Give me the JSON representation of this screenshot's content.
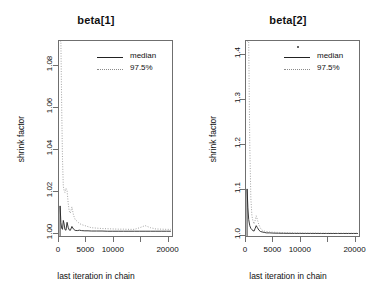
{
  "figure": {
    "xlabel": "last iteration in chain",
    "ylabel": "shrink factor",
    "legend": {
      "median_label": "median",
      "upper_label": "97.5%",
      "median_color": "#222222",
      "upper_color": "#8a8a8a"
    }
  },
  "chart_data": [
    {
      "type": "line",
      "title": "beta[1]",
      "xlabel": "last iteration in chain",
      "ylabel": "shrink factor",
      "xlim": [
        0,
        21000
      ],
      "ylim": [
        0.998,
        1.092
      ],
      "grid": false,
      "legend_position": "top-right",
      "legend_entries": [
        "median",
        "97.5%"
      ],
      "xticks": [
        0,
        5000,
        10000,
        15000,
        20000
      ],
      "xtick_labels": [
        "0",
        "5000",
        "10000",
        "",
        "20000"
      ],
      "yticks": [
        1.0,
        1.02,
        1.04,
        1.06,
        1.08
      ],
      "ytick_labels": [
        "1.00",
        "1.02",
        "1.04",
        "1.06",
        "1.08"
      ],
      "x": [
        200,
        350,
        500,
        650,
        800,
        950,
        1100,
        1300,
        1500,
        1700,
        1900,
        2100,
        2400,
        2700,
        3000,
        3400,
        3800,
        4200,
        4800,
        5400,
        6000,
        7000,
        8000,
        9000,
        10000,
        11000,
        12000,
        13000,
        14000,
        15000,
        16000,
        17000,
        18000,
        19000,
        20000,
        20800
      ],
      "series": [
        {
          "name": "median",
          "style": "solid",
          "values": [
            1.0125,
            1.0045,
            1.0018,
            1.0012,
            1.0055,
            1.0038,
            1.0011,
            1.0008,
            1.0046,
            1.0022,
            1.0009,
            1.0007,
            1.0026,
            1.0013,
            1.0007,
            1.0006,
            1.0008,
            1.0006,
            1.0005,
            1.0005,
            1.0004,
            1.0004,
            1.0004,
            1.0003,
            1.0003,
            1.0003,
            1.0003,
            1.0003,
            1.0003,
            1.0003,
            1.0003,
            1.0003,
            1.0003,
            1.0003,
            1.0003,
            1.0003
          ]
        },
        {
          "name": "97.5%",
          "style": "dotted",
          "values": [
            1.092,
            1.092,
            1.06,
            1.035,
            1.022,
            1.02,
            1.019,
            1.021,
            1.02,
            1.014,
            1.01,
            1.009,
            1.012,
            1.008,
            1.006,
            1.005,
            1.004,
            1.0035,
            1.003,
            1.0025,
            1.002,
            1.0018,
            1.0016,
            1.0015,
            1.0014,
            1.0013,
            1.0013,
            1.0012,
            1.0012,
            1.002,
            1.003,
            1.002,
            1.0014,
            1.0013,
            1.0012,
            1.0012
          ]
        }
      ]
    },
    {
      "type": "line",
      "title": "beta[2]",
      "xlabel": "last iteration in chain",
      "ylabel": "shrink factor",
      "xlim": [
        0,
        21000
      ],
      "ylim": [
        0.995,
        1.43
      ],
      "grid": false,
      "legend_position": "top-right",
      "legend_entries": [
        "median",
        "97.5%"
      ],
      "xticks": [
        0,
        5000,
        10000,
        15000,
        20000
      ],
      "xtick_labels": [
        "0",
        "5000",
        "10000",
        "",
        "20000"
      ],
      "yticks": [
        1.0,
        1.1,
        1.2,
        1.3,
        1.4
      ],
      "ytick_labels": [
        "1.0",
        "1.1",
        "1.2",
        "1.3",
        "1.4"
      ],
      "x": [
        200,
        350,
        500,
        700,
        900,
        1100,
        1300,
        1500,
        1700,
        1900,
        2100,
        2400,
        2700,
        3000,
        3400,
        3800,
        4400,
        5000,
        6000,
        7000,
        8000,
        9000,
        10000,
        11000,
        12000,
        13000,
        14000,
        15000,
        16000,
        17000,
        18000,
        19000,
        20000,
        20800
      ],
      "series": [
        {
          "name": "median",
          "style": "solid",
          "values": [
            1.1,
            1.058,
            1.032,
            1.018,
            1.012,
            1.009,
            1.007,
            1.006,
            1.012,
            1.018,
            1.014,
            1.008,
            1.005,
            1.004,
            1.003,
            1.002,
            1.002,
            1.0015,
            1.0012,
            1.001,
            1.0009,
            1.0008,
            1.0008,
            1.0007,
            1.0007,
            1.0007,
            1.0006,
            1.0006,
            1.0006,
            1.0006,
            1.0006,
            1.0006,
            1.0006,
            1.0006
          ]
        },
        {
          "name": "97.5%",
          "style": "dotted",
          "values": [
            1.43,
            1.43,
            1.43,
            1.2,
            1.08,
            1.04,
            1.028,
            1.022,
            1.03,
            1.04,
            1.032,
            1.02,
            1.012,
            1.008,
            1.006,
            1.005,
            1.004,
            1.0035,
            1.003,
            1.0025,
            1.002,
            1.0018,
            1.0017,
            1.0016,
            1.0015,
            1.0014,
            1.0014,
            1.0013,
            1.0013,
            1.0012,
            1.0012,
            1.0012,
            1.0012,
            1.0012
          ]
        }
      ]
    }
  ]
}
